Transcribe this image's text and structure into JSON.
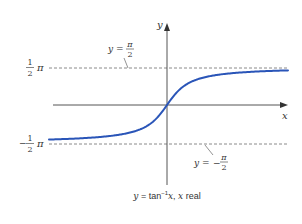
{
  "chart_data": {
    "type": "line",
    "title": "",
    "caption": "y = tan⁻¹x, x real",
    "caption_parts": {
      "y": "y",
      "eq": " = ",
      "func": "tan",
      "sup": "−1",
      "x": "x",
      "sep": ", ",
      "x2": "x",
      "real": " real"
    },
    "xlabel": "x",
    "ylabel": "y",
    "function": "arctan(x)",
    "domain": "x real",
    "ylim": [
      -1.5708,
      1.5708
    ],
    "yticks": [
      {
        "value": 1.5708,
        "label_num": "1",
        "label_den": "2",
        "label_sym": "π",
        "sign": ""
      },
      {
        "value": -1.5708,
        "label_num": "1",
        "label_den": "2",
        "label_sym": "π",
        "sign": "−"
      }
    ],
    "asymptotes": [
      {
        "value": 1.5708,
        "label_lhs": "y = ",
        "label_sign": "",
        "label_num": "π",
        "label_den": "2",
        "style": "dashed"
      },
      {
        "value": -1.5708,
        "label_lhs": "y = ",
        "label_sign": "−",
        "label_num": "π",
        "label_den": "2",
        "style": "dashed"
      }
    ],
    "series": [
      {
        "name": "y = tan⁻¹x",
        "color": "#2a55b8",
        "x": [
          -6,
          -4,
          -3,
          -2,
          -1,
          0,
          1,
          2,
          3,
          4,
          6
        ],
        "y": [
          -1.406,
          -1.326,
          -1.249,
          -1.107,
          -0.785,
          0,
          0.785,
          1.107,
          1.249,
          1.326,
          1.406
        ]
      }
    ],
    "grid": false,
    "legend": "none"
  },
  "colors": {
    "curve": "#2a55b8",
    "axis": "#555555",
    "asymptote": "#888888",
    "text": "#333333"
  }
}
